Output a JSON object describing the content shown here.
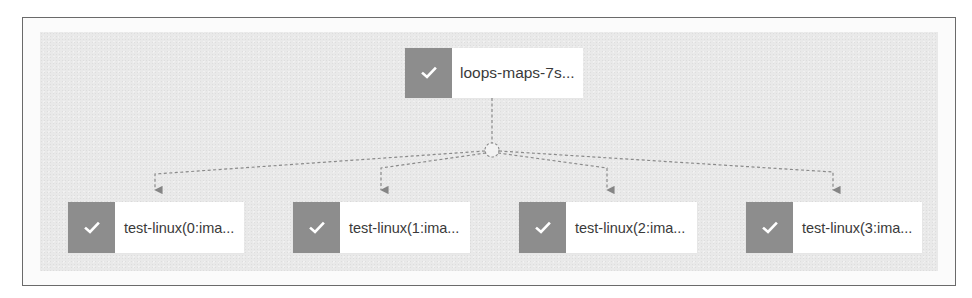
{
  "diagram": {
    "type": "workflow-graph",
    "colors": {
      "frame_border": "#6a6a6a",
      "canvas_background": "#e9e9e9",
      "node_status_fill": "#8d8d8d",
      "node_label_background": "#ffffff",
      "edge_color": "#8a8a8a",
      "check_color": "#ffffff"
    },
    "root_node": {
      "label": "loops-maps-7s...",
      "status": "succeeded",
      "status_icon": "check-icon"
    },
    "junction": {
      "shape": "dashed-circle"
    },
    "child_nodes": [
      {
        "label": "test-linux(0:ima...",
        "status": "succeeded",
        "status_icon": "check-icon"
      },
      {
        "label": "test-linux(1:ima...",
        "status": "succeeded",
        "status_icon": "check-icon"
      },
      {
        "label": "test-linux(2:ima...",
        "status": "succeeded",
        "status_icon": "check-icon"
      },
      {
        "label": "test-linux(3:ima...",
        "status": "succeeded",
        "status_icon": "check-icon"
      }
    ],
    "edges": [
      {
        "from": "root",
        "to": "junction",
        "style": "dashed"
      },
      {
        "from": "junction",
        "to": "child-0",
        "style": "dashed",
        "arrow": true
      },
      {
        "from": "junction",
        "to": "child-1",
        "style": "dashed",
        "arrow": true
      },
      {
        "from": "junction",
        "to": "child-2",
        "style": "dashed",
        "arrow": true
      },
      {
        "from": "junction",
        "to": "child-3",
        "style": "dashed",
        "arrow": true
      }
    ]
  }
}
